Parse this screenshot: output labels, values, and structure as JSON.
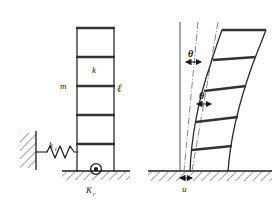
{
  "figure": {
    "background_color": "#ffffff",
    "line_color": "#1a1a1a",
    "beam_color": "#333333",
    "hatch_color": "#444444",
    "canvas": {
      "width": 278,
      "height": 204
    }
  },
  "left_panel": {
    "name": "undeformed-frame-panel",
    "description": "Upright five-storey shear building idealisation supported by a translational spring and a rotational spring at its base.",
    "labels": {
      "mass": "m",
      "stiffness": "k",
      "storey_height": "ℓ",
      "translational_spring": "k",
      "translational_spring_subscript": "t",
      "rotational_spring": "K",
      "rotational_spring_subscript": "r"
    },
    "frame": {
      "storeys": 5,
      "column_left_x": 77,
      "column_right_x": 114,
      "top_y": 28,
      "base_y": 172,
      "floor_levels_y": [
        28,
        57,
        86,
        115,
        144,
        172
      ]
    },
    "supports": {
      "wall_hatch": "left fixed wall with diagonal hatching",
      "ground_hatch": "horizontal ground line with diagonal hatching",
      "base_hinge": "circular pin / rotational spring symbol at column base"
    }
  },
  "right_panel": {
    "name": "deformed-frame-panel",
    "description": "Same frame displaced: the base slides by u and the structure rotates by theta relative to the vertical reference, with an additional storey drift rotation theta shown higher up.",
    "labels": {
      "rotation_upper": "θ",
      "rotation_lower": "θ",
      "base_displacement": "u"
    },
    "reference_lines": [
      {
        "name": "vertical-reference-line",
        "style": "solid",
        "x_top": 180,
        "x_bottom": 180
      },
      {
        "name": "rigid-rotation-line",
        "style": "dash-dot",
        "x_top": 198,
        "x_bottom": 184
      },
      {
        "name": "tangent-reference-line",
        "style": "dash-dot",
        "x_top": 218,
        "x_bottom": 192
      }
    ],
    "frame": {
      "storeys": 5,
      "base_left_x": 190,
      "base_right_x": 228,
      "top_left_x": 222,
      "top_right_x": 266,
      "top_y": 30,
      "base_y": 172
    },
    "arrows": {
      "theta_upper_arrow": "double-headed horizontal arrow under upper theta",
      "theta_lower_arrow": "double-headed horizontal arrow under lower theta",
      "u_arrow": "double-headed horizontal arrow at ground line marking base slip u"
    },
    "supports": {
      "ground_hatch": "horizontal ground line with diagonal hatching"
    }
  }
}
